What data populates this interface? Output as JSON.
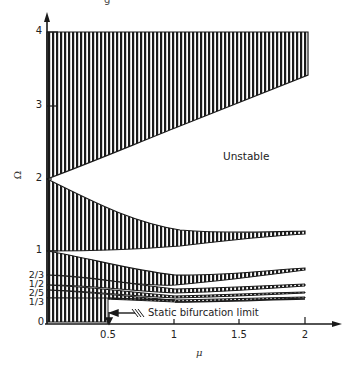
{
  "figure": {
    "top_fragment": "g",
    "y_axis": {
      "title": "Ω",
      "ticks": [
        {
          "label": "0",
          "value": 0
        },
        {
          "label": "1/3",
          "value": 0.333
        },
        {
          "label": "2/5",
          "value": 0.4
        },
        {
          "label": "1/2",
          "value": 0.5
        },
        {
          "label": "2/3",
          "value": 0.667
        },
        {
          "label": "1",
          "value": 1
        },
        {
          "label": "2",
          "value": 2
        },
        {
          "label": "3",
          "value": 3
        },
        {
          "label": "4",
          "value": 4
        }
      ]
    },
    "x_axis": {
      "title": "μ",
      "ticks": [
        {
          "label": "0.5",
          "value": 0.5
        },
        {
          "label": "1",
          "value": 1
        },
        {
          "label": "1.5",
          "value": 1.5
        },
        {
          "label": "2",
          "value": 2
        }
      ]
    },
    "labels": {
      "unstable": "Unstable",
      "static_limit": "Static bifurcation limit"
    },
    "colors": {
      "ink": "#1a1a1a",
      "background": "#ffffff"
    }
  }
}
